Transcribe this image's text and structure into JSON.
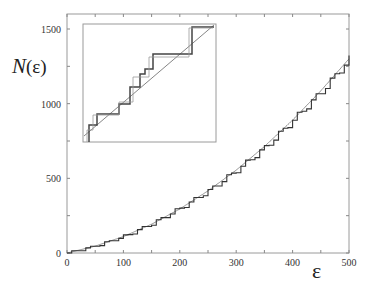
{
  "chart_data": {
    "type": "line",
    "title": "",
    "xlabel": "ε",
    "ylabel": "N(ε)",
    "xlim": [
      0,
      500
    ],
    "ylim": [
      0,
      1600
    ],
    "grid": false,
    "legend": null,
    "x_ticks": [
      0,
      100,
      200,
      300,
      400,
      500
    ],
    "y_ticks": [
      0,
      500,
      1000,
      1500
    ],
    "x_minor_ticks": [
      50,
      150,
      250,
      350,
      450
    ],
    "y_minor_ticks": [
      250,
      750,
      1250
    ],
    "series": [
      {
        "name": "staircase N(ε)",
        "style": "step",
        "x": [
          0,
          50,
          100,
          150,
          200,
          250,
          300,
          350,
          400,
          450,
          500
        ],
        "values": [
          0,
          45,
          110,
          195,
          300,
          415,
          555,
          705,
          890,
          1080,
          1300
        ]
      },
      {
        "name": "smooth (Weyl) approximation",
        "style": "smooth",
        "x": [
          0,
          50,
          100,
          150,
          200,
          250,
          300,
          350,
          400,
          450,
          500
        ],
        "values": [
          0,
          46,
          110,
          193,
          295,
          416,
          555,
          713,
          890,
          1086,
          1300
        ]
      }
    ],
    "inset": {
      "description": "zoomed view of staircase vs smooth curve",
      "series": [
        "staircase (thick)",
        "staircase (thin)",
        "smooth line"
      ]
    }
  },
  "labels": {
    "x_axis_title": "ε",
    "y_axis_title": "N(ε)",
    "x_tick_labels": [
      "0",
      "100",
      "200",
      "300",
      "400",
      "500"
    ],
    "y_tick_labels": [
      "0",
      "500",
      "1000",
      "1500"
    ]
  }
}
